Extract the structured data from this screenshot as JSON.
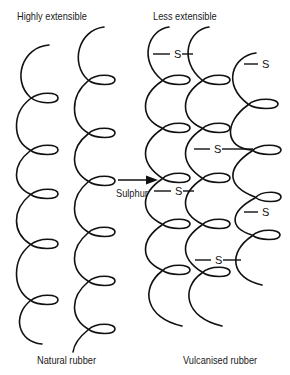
{
  "labels": {
    "top_left": "Highly extensible",
    "top_right": "Less extensible",
    "bottom_left": "Natural rubber",
    "bottom_right": "Vulcanised rubber",
    "arrow_label": "Sulphur"
  },
  "crosslink_atom": "S",
  "natural_rubber": {
    "chain_count": 2,
    "crosslinks": 0
  },
  "vulcanised_rubber": {
    "chain_count": 3,
    "crosslinks": 6
  },
  "colors": {
    "line": "#111111",
    "background": "#ffffff"
  }
}
